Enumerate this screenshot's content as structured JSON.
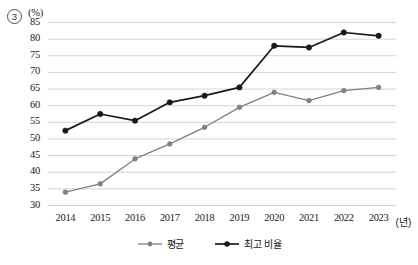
{
  "figure": {
    "item_number": "3",
    "unit_label": "(%)",
    "x_axis_unit": "(년)"
  },
  "legend": {
    "entries": [
      {
        "label": "평균",
        "color": "#808080",
        "marker": "line-dot-marker"
      },
      {
        "label": "최고 비율",
        "color": "#1a1a1a",
        "marker": "line-dot-marker"
      }
    ]
  },
  "chart_data": {
    "type": "line",
    "title": "",
    "subtitle": "",
    "xlabel": "(년)",
    "ylabel": "(%)",
    "categories": [
      "2014",
      "2015",
      "2016",
      "2017",
      "2018",
      "2019",
      "2020",
      "2021",
      "2022",
      "2023"
    ],
    "ylim": [
      30,
      85
    ],
    "ytick_labels": [
      "30",
      "35",
      "40",
      "45",
      "50",
      "55",
      "60",
      "65",
      "70",
      "75",
      "80",
      "85"
    ],
    "ytick_values": [
      30,
      35,
      40,
      45,
      50,
      55,
      60,
      65,
      70,
      75,
      80,
      85
    ],
    "grid": true,
    "grid_axis": "y",
    "legend_position": "bottom-center",
    "series": [
      {
        "name": "평균",
        "color": "#808080",
        "values": [
          34.0,
          36.5,
          44.0,
          48.5,
          53.5,
          59.5,
          64.0,
          61.5,
          64.5,
          65.5
        ]
      },
      {
        "name": "최고 비율",
        "color": "#1a1a1a",
        "values": [
          52.5,
          57.5,
          55.5,
          61.0,
          63.0,
          65.5,
          78.0,
          77.5,
          82.0,
          81.0
        ]
      }
    ]
  }
}
